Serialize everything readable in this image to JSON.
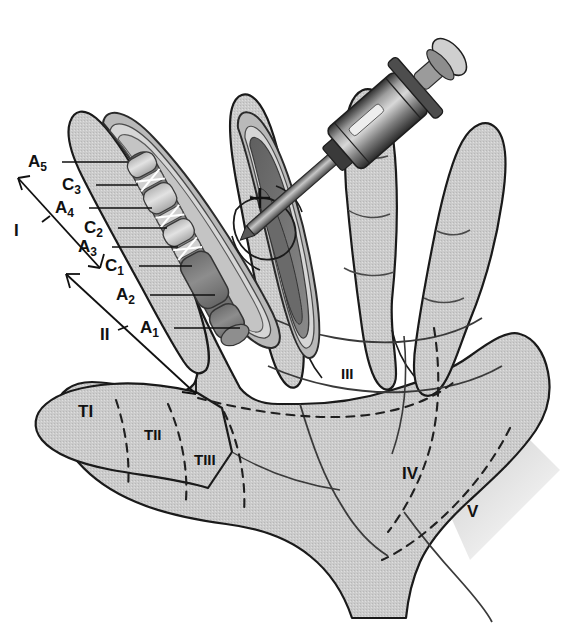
{
  "colors": {
    "skin_fill": "#c9c9c9",
    "skin_fill_light": "#d4d4d4",
    "outline": "#1a1a1a",
    "sheath_outer": "#b0b0b0",
    "sheath_mid": "#d8d8d8",
    "tendon_dark": "#7d7d7d",
    "tendon_mid": "#9a9a9a",
    "tendon_light": "#bdbdbd",
    "pulley_light": "#dcdcdc",
    "wound_dark": "#6f6f6f",
    "syringe_dark": "#3a3a3a",
    "syringe_mid": "#7a7a7a",
    "syringe_light": "#c2c2c2",
    "dashed_line": "#222222",
    "leader_line": "#111111",
    "background": "#ffffff"
  },
  "pulley_labels": [
    {
      "id": "a5",
      "base": "A",
      "sub": "5",
      "x": 28,
      "y": 167,
      "line_x1": 62,
      "line_y1": 162,
      "line_x2": 128,
      "line_y2": 162
    },
    {
      "id": "c3",
      "base": "C",
      "sub": "3",
      "x": 62,
      "y": 190,
      "line_x1": 96,
      "line_y1": 185,
      "line_x2": 138,
      "line_y2": 185
    },
    {
      "id": "a4",
      "base": "A",
      "sub": "4",
      "x": 55,
      "y": 213,
      "line_x1": 89,
      "line_y1": 208,
      "line_x2": 152,
      "line_y2": 208
    },
    {
      "id": "c2",
      "base": "C",
      "sub": "2",
      "x": 84,
      "y": 233,
      "line_x1": 118,
      "line_y1": 228,
      "line_x2": 167,
      "line_y2": 228
    },
    {
      "id": "a3",
      "base": "A",
      "sub": "3",
      "x": 78,
      "y": 252,
      "line_x1": 112,
      "line_y1": 247,
      "line_x2": 178,
      "line_y2": 247
    },
    {
      "id": "c1",
      "base": "C",
      "sub": "1",
      "x": 105,
      "y": 271,
      "line_x1": 139,
      "line_y1": 266,
      "line_x2": 192,
      "line_y2": 266
    },
    {
      "id": "a2",
      "base": "A",
      "sub": "2",
      "x": 116,
      "y": 300,
      "line_x1": 150,
      "line_y1": 295,
      "line_x2": 215,
      "line_y2": 295
    },
    {
      "id": "a1",
      "base": "A",
      "sub": "1",
      "x": 140,
      "y": 333,
      "line_x1": 174,
      "line_y1": 328,
      "line_x2": 240,
      "line_y2": 328
    }
  ],
  "zone_labels": [
    {
      "id": "zone-1",
      "text": "I",
      "x": 14,
      "y": 236
    },
    {
      "id": "zone-2",
      "text": "II",
      "x": 100,
      "y": 340
    },
    {
      "id": "zone-3",
      "text": "III",
      "x": 341,
      "y": 379
    },
    {
      "id": "zone-4",
      "text": "IV",
      "x": 402,
      "y": 479
    },
    {
      "id": "zone-5",
      "text": "V",
      "x": 467,
      "y": 517
    },
    {
      "id": "zone-t1",
      "text": "TI",
      "x": 78,
      "y": 417
    },
    {
      "id": "zone-t2",
      "text": "TII",
      "x": 144,
      "y": 440
    },
    {
      "id": "zone-t3",
      "text": "TIII",
      "x": 194,
      "y": 465
    }
  ],
  "anatomy": {
    "annular_pulleys": [
      "A1",
      "A2",
      "A3",
      "A4",
      "A5"
    ],
    "cruciate_pulleys": [
      "C1",
      "C2",
      "C3"
    ],
    "digit_zones": [
      "I",
      "II",
      "III",
      "IV",
      "V"
    ],
    "thumb_zones": [
      "TI",
      "TII",
      "TIII"
    ]
  },
  "instrument": {
    "name": "syringe-cannula",
    "description": "syringe with blunt cannula inserted into opened flexor sheath of middle finger"
  }
}
